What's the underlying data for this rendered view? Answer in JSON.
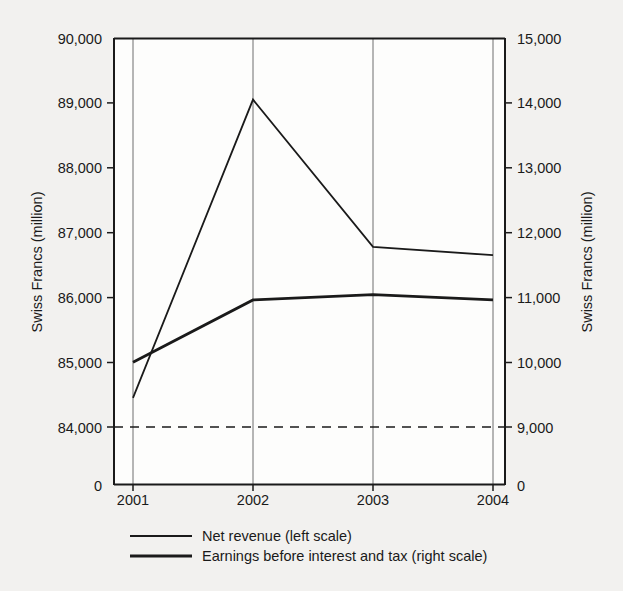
{
  "chart_data": {
    "type": "line",
    "title": "",
    "subtitle": "",
    "xlabel": "",
    "ylabel": "Swiss Francs (million)",
    "y2label": "Swiss Francs (million)",
    "categories": [
      "2001",
      "2002",
      "2003",
      "2004"
    ],
    "grid": true,
    "legend_position": "bottom",
    "axis_break": true,
    "axis_break_note": "dashed line indicates scale break between 0 and first tick",
    "left_axis": {
      "label": "Swiss Francs (million)",
      "ticks": [
        "0",
        "84,000",
        "85,000",
        "86,000",
        "87,000",
        "88,000",
        "89,000",
        "90,000"
      ],
      "tick_values": [
        0,
        84000,
        85000,
        86000,
        87000,
        88000,
        89000,
        90000
      ],
      "ylim": [
        84000,
        90000
      ]
    },
    "right_axis": {
      "label": "Swiss Francs (million)",
      "ticks": [
        "0",
        "9,000",
        "10,000",
        "11,000",
        "12,000",
        "13,000",
        "14,000",
        "15,000"
      ],
      "tick_values": [
        0,
        9000,
        10000,
        11000,
        12000,
        13000,
        14000,
        15000
      ],
      "ylim": [
        9000,
        15000
      ]
    },
    "series": [
      {
        "name": "Net revenue (left scale)",
        "axis": "left",
        "stroke_width": 1.8,
        "values": [
          84450,
          89050,
          86780,
          86650
        ]
      },
      {
        "name": "Earnings before interest and tax (right scale)",
        "axis": "right",
        "stroke_width": 2.8,
        "values": [
          10000,
          10960,
          11040,
          10960
        ]
      }
    ]
  },
  "axes": {
    "left_title": "Swiss Francs (million)",
    "right_title": "Swiss Francs (million)",
    "left_ticks": [
      "90,000",
      "89,000",
      "88,000",
      "87,000",
      "86,000",
      "85,000",
      "84,000",
      "0"
    ],
    "right_ticks": [
      "15,000",
      "14,000",
      "13,000",
      "12,000",
      "11,000",
      "10,000",
      "9,000",
      "0"
    ],
    "x_ticks": [
      "2001",
      "2002",
      "2003",
      "2004"
    ]
  },
  "legend": {
    "items": [
      {
        "label": "Net revenue (left scale)",
        "swatch": "thin-line-swatch"
      },
      {
        "label": "Earnings before interest and tax (right scale)",
        "swatch": "thick-line-swatch"
      }
    ]
  },
  "colors": {
    "background": "#f2f1ef",
    "ink": "#1a1a1a",
    "grid": "#6f6f6f"
  }
}
